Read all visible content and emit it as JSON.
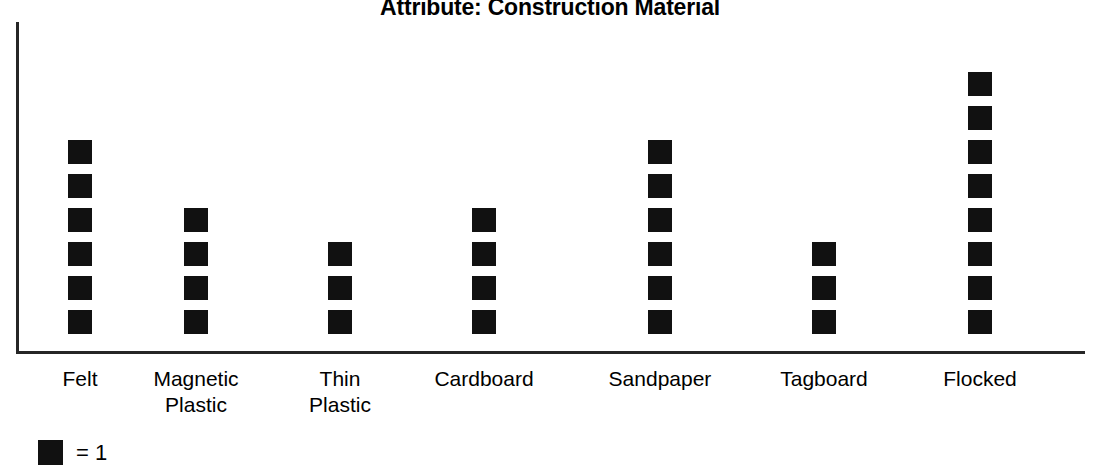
{
  "chart_data": {
    "type": "bar",
    "subtype": "pictograph",
    "title": "Attribute: Construction Material",
    "xlabel": "",
    "ylabel": "",
    "categories": [
      "Felt",
      "Magnetic\nPlastic",
      "Thin\nPlastic",
      "Cardboard",
      "Sandpaper",
      "Tagboard",
      "Flocked"
    ],
    "values": [
      6,
      4,
      3,
      4,
      6,
      3,
      8
    ],
    "ylim": [
      0,
      9
    ],
    "grid": false,
    "legend_position": "bottom-left",
    "icon_unit_value": 1,
    "legend_text": "= 1",
    "series": [
      {
        "name": "Construction Material",
        "values": [
          6,
          4,
          3,
          4,
          6,
          3,
          8
        ]
      }
    ],
    "data_points": [
      {
        "category": "Felt",
        "value": 6,
        "x_center": 80
      },
      {
        "category": "Magnetic Plastic",
        "value": 4,
        "x_center": 196
      },
      {
        "category": "Thin Plastic",
        "value": 3,
        "x_center": 340
      },
      {
        "category": "Cardboard",
        "value": 4,
        "x_center": 484
      },
      {
        "category": "Sandpaper",
        "value": 6,
        "x_center": 660
      },
      {
        "category": "Tagboard",
        "value": 3,
        "x_center": 824
      },
      {
        "category": "Flocked",
        "value": 8,
        "x_center": 980
      }
    ]
  },
  "colors": {
    "icon": "#111111",
    "axis": "#262626",
    "text": "#000000",
    "background": "#ffffff"
  },
  "legend": {
    "swatch_name": "black-square-icon",
    "label": "= 1"
  }
}
